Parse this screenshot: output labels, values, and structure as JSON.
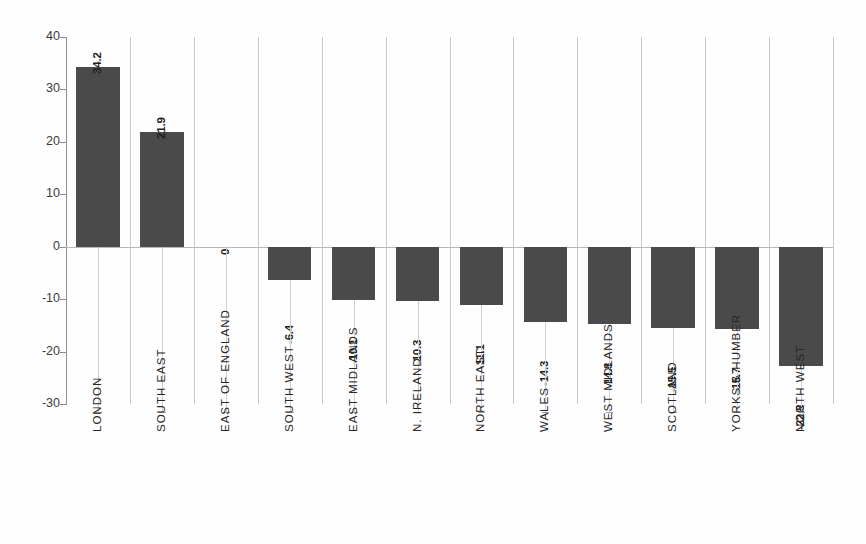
{
  "chart_data": {
    "type": "bar",
    "title": "",
    "subtitle": "",
    "xlabel": "",
    "ylabel": "",
    "ylim": [
      -30,
      40
    ],
    "yticks": [
      40,
      30,
      20,
      10,
      0,
      -10,
      -20,
      -30
    ],
    "ytick_labels": [
      "40",
      "30",
      "20",
      "10",
      "0",
      "-10",
      "-20",
      "-30"
    ],
    "grid": "vertical-category-boundaries",
    "legend": "none",
    "bar_color": "#4a4a4a",
    "zero_line_color": "#b9b9b9",
    "grid_color": "#c8c8c8",
    "axis_color": "#8f8f8f",
    "categories": [
      "LONDON",
      "SOUTH EAST",
      "EAST OF ENGLAND",
      "SOUTH WEST",
      "EAST MIDLANDS",
      "N. IRELAND",
      "NORTH EAST",
      "WALES",
      "WEST MIDLANDS",
      "SCOTLAND",
      "YORKS & HUMBER",
      "NORTH WEST"
    ],
    "values": [
      34.2,
      21.9,
      0,
      -6.4,
      -10.1,
      -10.3,
      -11.1,
      -14.3,
      -14.8,
      -15.5,
      -15.7,
      -22.8
    ],
    "value_labels": [
      "34.2",
      "21.9",
      "0",
      "-6.4",
      "-10.1",
      "-10.3",
      "-11.1",
      "-14.3",
      "-14.8",
      "-15.5",
      "-15.7",
      "-22.8"
    ]
  }
}
